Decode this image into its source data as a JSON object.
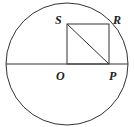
{
  "diagram": {
    "labels": {
      "S": "S",
      "R": "R",
      "O": "O",
      "P": "P"
    },
    "colors": {
      "stroke": "#333333",
      "background": "#ffffff"
    }
  }
}
